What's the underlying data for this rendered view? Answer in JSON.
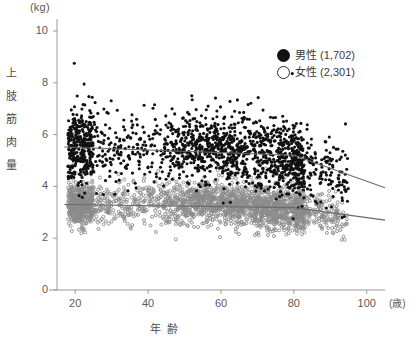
{
  "axes": {
    "y_unit": "(kg)",
    "y_label": "上肢筋肉量",
    "y_label_chars": [
      "上",
      "肢",
      "筋",
      "肉",
      "量"
    ],
    "y_ticks": [
      "0",
      "2",
      "4",
      "6",
      "8",
      "10"
    ],
    "x_unit": "(歳)",
    "x_label": "年齢",
    "x_ticks": [
      "20",
      "40",
      "60",
      "80",
      "100"
    ]
  },
  "legend": {
    "male": {
      "marker": "filled-circle",
      "label": "男性 (1,702)"
    },
    "female": {
      "marker": "open-circle",
      "label": "女性 (2,301)"
    }
  },
  "colors": {
    "male": "#111111",
    "female": "#8a8a8a",
    "axis": "#9a9a9a",
    "trend": "#6a6a6a",
    "text": "#4a4a4a"
  },
  "chart_data": {
    "type": "scatter",
    "title": "",
    "xlabel": "年齢",
    "ylabel": "上肢筋肉量",
    "x_unit": "歳",
    "y_unit": "kg",
    "xlim": [
      15,
      105
    ],
    "ylim": [
      0,
      10
    ],
    "xticks": [
      20,
      40,
      60,
      80,
      100
    ],
    "yticks": [
      0,
      2,
      4,
      6,
      8,
      10
    ],
    "grid": false,
    "legend_position": "top-right",
    "series": [
      {
        "name": "男性",
        "marker": "filled-circle",
        "color": "#111111",
        "n": 1702,
        "age_range": [
          18,
          95
        ],
        "y_center_by_age": [
          {
            "age": 18,
            "mean": 5.55,
            "sd": 0.8
          },
          {
            "age": 25,
            "mean": 5.6,
            "sd": 0.75
          },
          {
            "age": 35,
            "mean": 5.6,
            "sd": 0.7
          },
          {
            "age": 45,
            "mean": 5.55,
            "sd": 0.68
          },
          {
            "age": 55,
            "mean": 5.5,
            "sd": 0.68
          },
          {
            "age": 65,
            "mean": 5.4,
            "sd": 0.7
          },
          {
            "age": 75,
            "mean": 5.2,
            "sd": 0.7
          },
          {
            "age": 85,
            "mean": 4.7,
            "sd": 0.65
          },
          {
            "age": 95,
            "mean": 4.2,
            "sd": 0.55
          }
        ],
        "trend_line": {
          "x": [
            17,
            80,
            105
          ],
          "y": [
            5.52,
            5.2,
            3.95
          ]
        },
        "outlier_max": 9.0
      },
      {
        "name": "女性",
        "marker": "open-circle",
        "color": "#8a8a8a",
        "n": 2301,
        "age_range": [
          18,
          95
        ],
        "y_center_by_age": [
          {
            "age": 18,
            "mean": 3.3,
            "sd": 0.42
          },
          {
            "age": 25,
            "mean": 3.32,
            "sd": 0.4
          },
          {
            "age": 35,
            "mean": 3.35,
            "sd": 0.4
          },
          {
            "age": 45,
            "mean": 3.36,
            "sd": 0.4
          },
          {
            "age": 55,
            "mean": 3.35,
            "sd": 0.42
          },
          {
            "age": 65,
            "mean": 3.3,
            "sd": 0.42
          },
          {
            "age": 75,
            "mean": 3.2,
            "sd": 0.42
          },
          {
            "age": 85,
            "mean": 3.0,
            "sd": 0.4
          },
          {
            "age": 95,
            "mean": 2.8,
            "sd": 0.35
          }
        ],
        "trend_line": {
          "x": [
            17,
            80,
            105
          ],
          "y": [
            3.3,
            3.18,
            2.7
          ]
        },
        "outlier_max": 5.2
      }
    ]
  }
}
